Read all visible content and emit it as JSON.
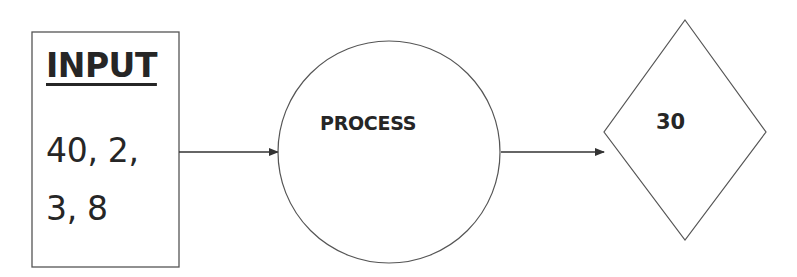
{
  "diagram": {
    "type": "flowchart",
    "nodes": [
      {
        "id": "input",
        "shape": "rectangle",
        "title": "INPUT",
        "lines": [
          "40, 2,",
          "3, 8"
        ]
      },
      {
        "id": "process",
        "shape": "circle",
        "label": "PROCESS"
      },
      {
        "id": "output",
        "shape": "diamond",
        "label": "30"
      }
    ],
    "edges": [
      {
        "from": "input",
        "to": "process"
      },
      {
        "from": "process",
        "to": "output"
      }
    ],
    "colors": {
      "stroke": "#555555",
      "text": "#262626",
      "background": "#ffffff"
    }
  }
}
